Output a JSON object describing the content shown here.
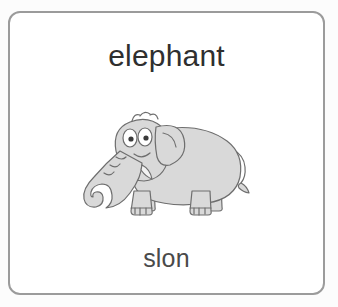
{
  "card": {
    "title": "elephant",
    "caption": "slon",
    "border_color": "#9b9b9b",
    "background_color": "#ffffff",
    "title_color": "#2f2f2f",
    "caption_color": "#4a4a4a"
  },
  "page": {
    "background_color": "#fcfcfc"
  },
  "illustration": {
    "subject": "elephant",
    "style": "cartoon line drawing",
    "body_fill": "#d9d9d9",
    "shadow_fill": "#c4c4c4",
    "outline_color": "#6e6e6e",
    "eye_fill": "#ffffff",
    "pupil_fill": "#3a3a3a",
    "tusk_fill": "#f2f2f2",
    "parts": [
      "body",
      "head",
      "ear",
      "trunk",
      "tusk",
      "eyes",
      "hair-tuft",
      "front-leg",
      "hind-leg",
      "tail"
    ]
  }
}
